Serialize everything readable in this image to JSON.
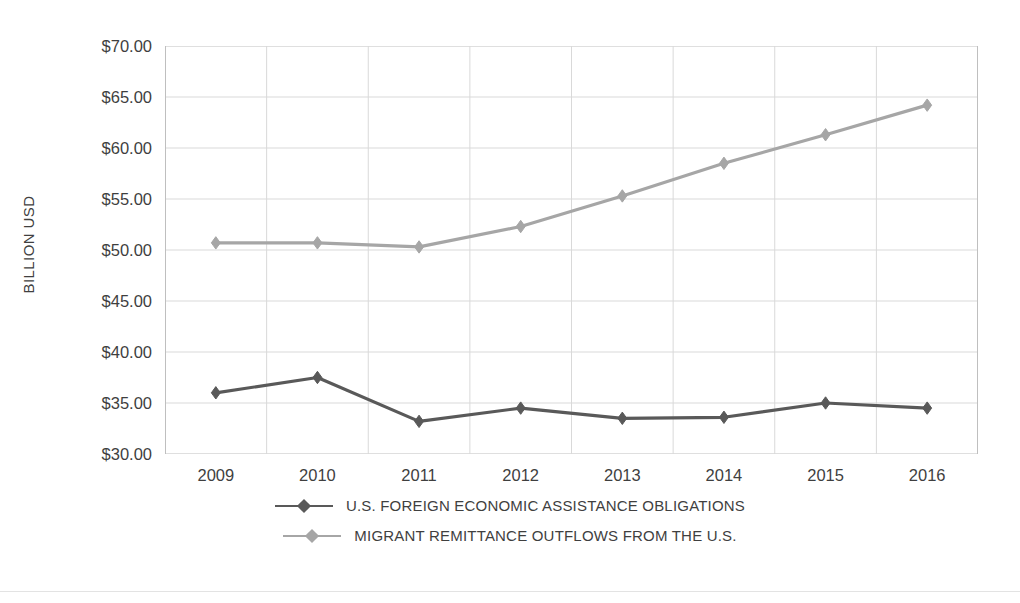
{
  "chart_data": {
    "type": "line",
    "title": "",
    "xlabel": "",
    "ylabel": "BILLION USD",
    "categories": [
      "2009",
      "2010",
      "2011",
      "2012",
      "2013",
      "2014",
      "2015",
      "2016"
    ],
    "ylim": [
      30,
      70
    ],
    "ytick_step": 5,
    "ytick_labels": [
      "$70.00",
      "$65.00",
      "$60.00",
      "$55.00",
      "$50.00",
      "$45.00",
      "$40.00",
      "$35.00",
      "$30.00"
    ],
    "ytick_values": [
      70,
      65,
      60,
      55,
      50,
      45,
      40,
      35,
      30
    ],
    "grid": true,
    "grid_x": true,
    "grid_y": true,
    "legend_position": "bottom",
    "marker": "diamond",
    "series": [
      {
        "name": "U.S. FOREIGN ECONOMIC ASSISTANCE OBLIGATIONS",
        "color": "#595959",
        "values": [
          36.0,
          37.5,
          33.2,
          34.5,
          33.5,
          33.6,
          35.0,
          34.5
        ]
      },
      {
        "name": "MIGRANT REMITTANCE OUTFLOWS FROM THE U.S.",
        "color": "#a6a6a6",
        "values": [
          50.7,
          50.7,
          50.3,
          52.3,
          55.3,
          58.5,
          61.3,
          64.2
        ]
      }
    ]
  },
  "colors": {
    "background": "#ffffff",
    "grid": "#d9d9d9",
    "axis": "#bfbfbf",
    "text": "#404040",
    "series_dark": "#595959",
    "series_light": "#a6a6a6"
  }
}
